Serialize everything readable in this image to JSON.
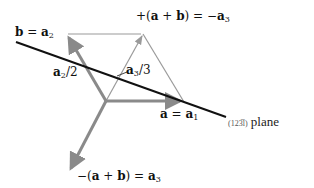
{
  "diagram": {
    "labels": {
      "b_a2": {
        "b": "b",
        "eq": " = ",
        "a": "a",
        "sub": "2"
      },
      "top": {
        "pre": "+(",
        "a": "a",
        "plus": " + ",
        "b": "b",
        "post": ") = −",
        "a3": "a",
        "sub": "3"
      },
      "a2_half": {
        "a": "a",
        "sub": "2",
        "frac": "/2"
      },
      "a3_third": {
        "pre": "−",
        "a": "a",
        "sub": "3",
        "frac": "/3"
      },
      "a_a1": {
        "a": "a",
        "eq": " = ",
        "a1": "a",
        "sub": "1"
      },
      "bottom": {
        "pre": "−(",
        "a": "a",
        "plus": " + ",
        "b": "b",
        "post": ") = ",
        "a3": "a",
        "sub": "3"
      },
      "plane": {
        "idx": "(123̅l)",
        "text": " plane"
      }
    },
    "colors": {
      "thick_vector": "#8a8a8a",
      "thin_line": "#9a9a9a",
      "plane_trace": "#111111"
    }
  }
}
